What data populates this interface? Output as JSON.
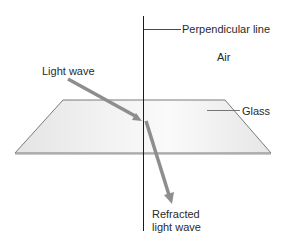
{
  "diagram": {
    "type": "refraction-illustration",
    "labels": {
      "perpendicular": "Perpendicular line",
      "air": "Air",
      "light_wave": "Light wave",
      "glass": "Glass",
      "refracted_line1": "Refracted",
      "refracted_line2": "light wave"
    },
    "colors": {
      "background": "#ffffff",
      "line": "#1a1a1a",
      "arrow": "#8e8e8e",
      "glass_fill": "#ececec",
      "glass_edge": "#7a7a7a",
      "text": "#2a2a2a"
    },
    "elements": [
      {
        "name": "perpendicular-line",
        "kind": "line"
      },
      {
        "name": "glass-slab",
        "kind": "trapezoid"
      },
      {
        "name": "incident-light-wave",
        "kind": "arrow"
      },
      {
        "name": "refracted-light-wave",
        "kind": "arrow"
      }
    ]
  }
}
